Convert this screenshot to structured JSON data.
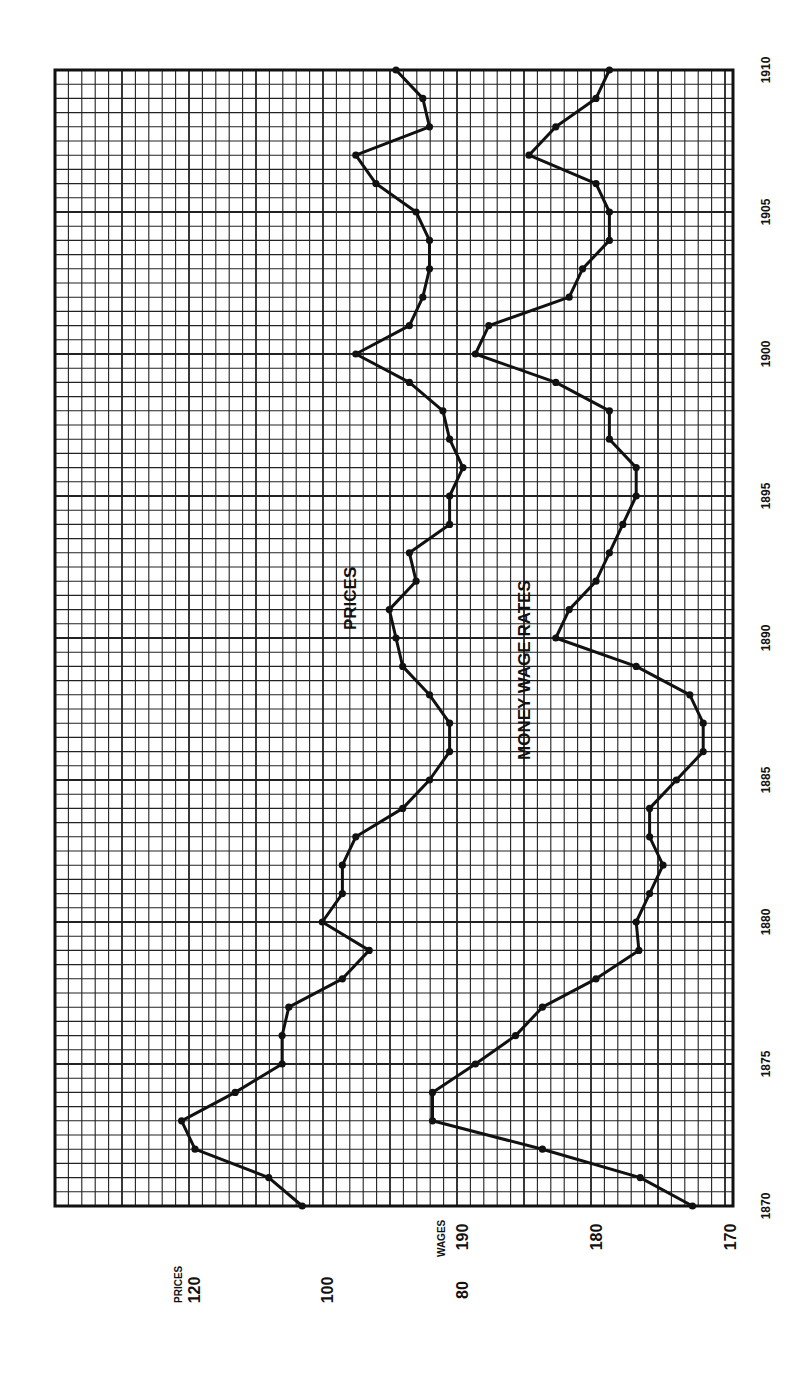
{
  "chart_data": {
    "type": "line",
    "orientation": "rotated-90-ccw",
    "title": "",
    "xlabel": "",
    "x": [
      1870,
      1871,
      1872,
      1873,
      1874,
      1875,
      1876,
      1877,
      1878,
      1879,
      1880,
      1881,
      1882,
      1883,
      1884,
      1885,
      1886,
      1887,
      1888,
      1889,
      1890,
      1891,
      1892,
      1893,
      1894,
      1895,
      1896,
      1897,
      1898,
      1899,
      1900,
      1901,
      1902,
      1903,
      1904,
      1905,
      1906,
      1907,
      1908,
      1909,
      1910
    ],
    "x_ticks": [
      "1870",
      "1875",
      "1880",
      "1885",
      "1890",
      "1895",
      "1900",
      "1905",
      "1910"
    ],
    "series": [
      {
        "name": "PRICES",
        "axis": "PRICES",
        "values": [
          104,
          109,
          120,
          122,
          114,
          107,
          107,
          106,
          98,
          94,
          101,
          98,
          98,
          96,
          89,
          85,
          82,
          82,
          85,
          89,
          90,
          91,
          87,
          88,
          82,
          82,
          80,
          82,
          83,
          88,
          96,
          88,
          86,
          85,
          85,
          87,
          93,
          96,
          85,
          86,
          90
        ]
      },
      {
        "name": "MONEY WAGE RATES",
        "axis": "WAGES",
        "values": [
          172.8,
          176.7,
          184,
          192.2,
          192.2,
          189,
          186,
          184,
          180,
          176.8,
          177,
          176,
          175,
          176,
          176,
          174,
          172,
          172,
          173,
          177,
          183,
          182,
          180,
          179,
          178,
          177,
          177,
          179,
          179,
          183,
          189,
          188,
          182,
          181,
          179,
          179,
          180,
          185,
          183,
          180,
          179
        ]
      }
    ],
    "axes": {
      "prices": {
        "label": "PRICES",
        "ticks": [
          "120",
          "100",
          "80"
        ],
        "range": [
          120,
          80
        ]
      },
      "wages": {
        "label": "WAGES",
        "ticks": [
          "190",
          "180",
          "170"
        ],
        "range": [
          190,
          170
        ]
      }
    },
    "annotations": [
      "PRICES",
      "MONEY WAGE RATES"
    ],
    "grid": true,
    "legend": "none"
  },
  "labels": {
    "prices_axis_title": "PRICES",
    "wages_axis_title": "WAGES",
    "prices_series_label": "PRICES",
    "wages_series_label": "MONEY WAGE RATES"
  }
}
